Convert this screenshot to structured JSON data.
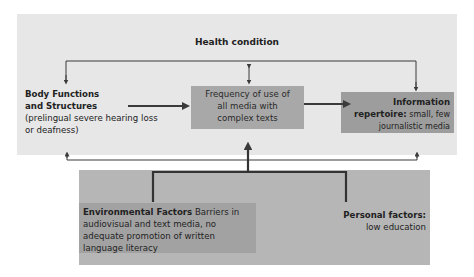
{
  "diagram": {
    "health_condition": {
      "label": "Health condition"
    },
    "body_functions": {
      "title_line1": "Body Functions",
      "title_line2": "and Structures",
      "detail_line1": "(prelingual severe hearing loss",
      "detail_line2": "or deafness)"
    },
    "frequency": {
      "line1": "Frequency of use of",
      "line2": "all media with",
      "line3": "complex texts"
    },
    "information_repertoire": {
      "title_line1": "Information",
      "title_line2": "repertoire:",
      "detail_inline": " small, few",
      "detail_line3": "journalistic media"
    },
    "environmental_factors": {
      "title": "Environmental Factors",
      "detail_inline": " Barriers in",
      "line2": "audiovisual and text media, no",
      "line3": "adequate promotion of written",
      "line4": "language literacy"
    },
    "personal_factors": {
      "title": "Personal factors:",
      "detail": "low education"
    },
    "colors": {
      "top_panel": "#e7e7e7",
      "bottom_panel": "#b6b6b6",
      "frequency_box": "#a8a8a8",
      "info_box": "#9d9d9d",
      "env_box": "#a2a2a2",
      "lines": "#3a3a3a"
    }
  }
}
